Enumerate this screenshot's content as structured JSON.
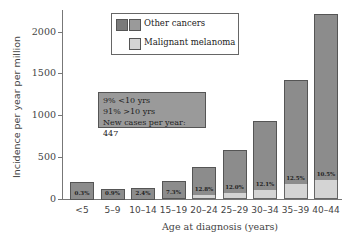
{
  "chart_data": {
    "type": "bar",
    "stacked": true,
    "title": "",
    "xlabel": "Age at diagnosis (years)",
    "ylabel": "Incidence per year per million",
    "ylim": [
      0,
      2250
    ],
    "yticks": [
      0,
      500,
      1000,
      1500,
      2000
    ],
    "grid": false,
    "legend_position": "top-left inside",
    "categories": [
      "<5",
      "5–9",
      "10–14",
      "15–19",
      "20–24",
      "25–29",
      "30–34",
      "35–39",
      "40–44"
    ],
    "series": [
      {
        "name": "Malignant melanoma",
        "color": "#d4d4d4",
        "values": [
          1,
          1,
          3,
          15,
          49,
          71,
          113,
          179,
          233
        ]
      },
      {
        "name": "Other cancers",
        "color": "#8c8c8c",
        "values": [
          199,
          119,
          127,
          195,
          331,
          519,
          817,
          1251,
          1987
        ]
      }
    ],
    "totals": [
      200,
      120,
      130,
      210,
      380,
      590,
      930,
      1430,
      2220
    ],
    "bar_labels": [
      "0.3%",
      "0.9%",
      "2.4%",
      "7.3%",
      "12.8%",
      "12.0%",
      "12.1%",
      "12.5%",
      "10.5%"
    ],
    "annotations": [
      "9% <10 yrs",
      "91% >10 yrs",
      "New cases per year: 447"
    ]
  },
  "legend": {
    "other": "Other cancers",
    "melanoma": "Malignant melanoma"
  },
  "note": {
    "line1": "9% <10 yrs",
    "line2": "91% >10 yrs",
    "line3": "New cases per year: 447"
  },
  "axis": {
    "y_title": "Incidence per year per million",
    "x_title": "Age at diagnosis (years)",
    "y_ticks": [
      "0",
      "500",
      "1000",
      "1500",
      "2000"
    ]
  }
}
